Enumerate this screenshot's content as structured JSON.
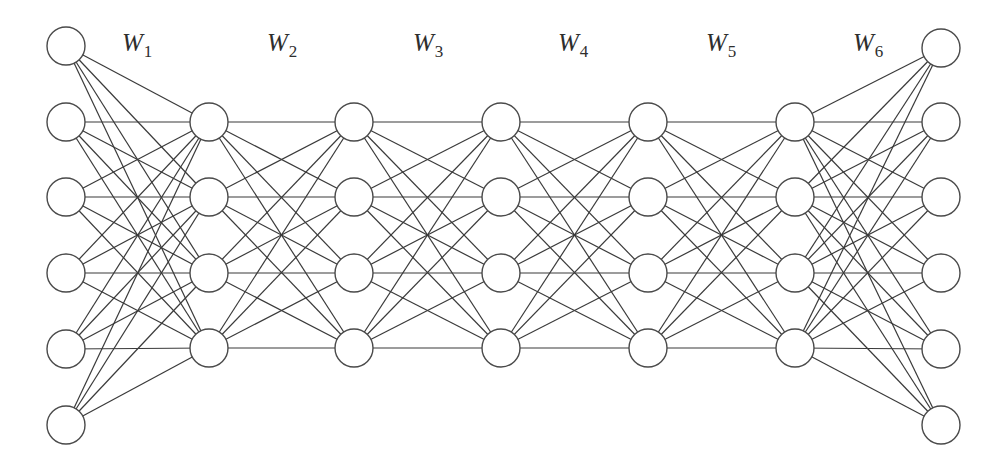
{
  "diagram": {
    "title": "",
    "type": "fully-connected neural network",
    "colors": {
      "edge": "#3a3a3a",
      "node_stroke": "#4a4a4a",
      "node_fill": "#ffffff",
      "label": "#2e2e2e"
    },
    "node_radius": 19,
    "layers": [
      {
        "name": "input",
        "size": 6,
        "x": 66,
        "ys": [
          46,
          122,
          197,
          273,
          349,
          425
        ]
      },
      {
        "name": "hidden-1",
        "size": 4,
        "x": 209,
        "ys": [
          122,
          197,
          273,
          348
        ]
      },
      {
        "name": "hidden-2",
        "size": 4,
        "x": 354,
        "ys": [
          122,
          197,
          273,
          348
        ]
      },
      {
        "name": "hidden-3",
        "size": 4,
        "x": 501,
        "ys": [
          122,
          197,
          273,
          348
        ]
      },
      {
        "name": "hidden-4",
        "size": 4,
        "x": 648,
        "ys": [
          122,
          197,
          273,
          348
        ]
      },
      {
        "name": "hidden-5",
        "size": 4,
        "x": 795,
        "ys": [
          122,
          197,
          273,
          348
        ]
      },
      {
        "name": "output",
        "size": 6,
        "x": 941,
        "ys": [
          48,
          122,
          197,
          273,
          349,
          425
        ]
      }
    ],
    "weights": [
      {
        "symbol": "W",
        "subscript": "1",
        "x": 122,
        "y": 30
      },
      {
        "symbol": "W",
        "subscript": "2",
        "x": 267,
        "y": 30
      },
      {
        "symbol": "W",
        "subscript": "3",
        "x": 413,
        "y": 30
      },
      {
        "symbol": "W",
        "subscript": "4",
        "x": 558,
        "y": 30
      },
      {
        "symbol": "W",
        "subscript": "5",
        "x": 706,
        "y": 30
      },
      {
        "symbol": "W",
        "subscript": "6",
        "x": 853,
        "y": 30
      }
    ]
  }
}
